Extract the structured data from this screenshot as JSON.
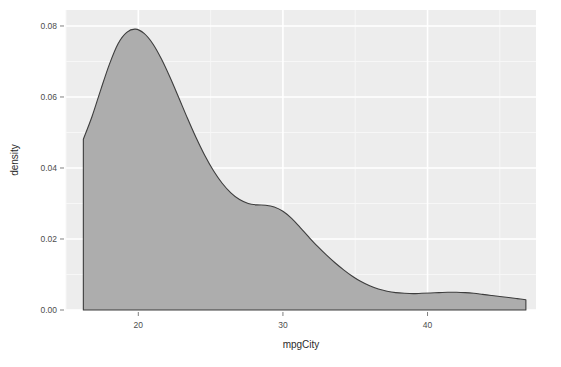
{
  "chart_data": {
    "type": "area",
    "title": "",
    "subtitle": "",
    "xlabel": "mpgCity",
    "ylabel": "density",
    "xlim": [
      15.0,
      47.5
    ],
    "ylim": [
      0.0,
      0.0845
    ],
    "x_ticks": [
      20,
      30,
      40
    ],
    "x_tick_labels": [
      "20",
      "30",
      "40"
    ],
    "y_ticks": [
      0.0,
      0.02,
      0.04,
      0.06,
      0.08
    ],
    "y_tick_labels": [
      "0.00",
      "0.02",
      "0.04",
      "0.06",
      "0.08"
    ],
    "x_minor_ticks": [
      15,
      25,
      35,
      45
    ],
    "y_minor_ticks": [
      0.01,
      0.03,
      0.05,
      0.07
    ],
    "grid": true,
    "legend": "none",
    "series": [
      {
        "name": "density",
        "fill_color": "#ADADAD",
        "line_color": "#3d3d3d",
        "x": [
          16.2,
          16.8,
          17.4,
          18.0,
          18.6,
          19.2,
          19.8,
          20.4,
          21.0,
          21.6,
          22.2,
          22.8,
          23.4,
          24.0,
          24.6,
          25.2,
          25.8,
          26.4,
          27.0,
          27.6,
          28.2,
          28.8,
          29.4,
          30.0,
          30.6,
          31.2,
          31.8,
          32.4,
          33.0,
          33.6,
          34.2,
          34.8,
          35.4,
          36.0,
          36.6,
          37.2,
          37.8,
          38.4,
          39.0,
          39.6,
          40.2,
          40.8,
          41.4,
          42.0,
          42.6,
          43.2,
          43.8,
          44.4,
          45.0,
          45.6,
          46.2,
          46.8
        ],
        "y": [
          0.0481,
          0.0545,
          0.062,
          0.0692,
          0.075,
          0.0782,
          0.0791,
          0.0779,
          0.075,
          0.0707,
          0.0655,
          0.0598,
          0.054,
          0.0485,
          0.0435,
          0.0392,
          0.0357,
          0.033,
          0.0311,
          0.03,
          0.0296,
          0.0295,
          0.029,
          0.0278,
          0.0258,
          0.0232,
          0.0205,
          0.0179,
          0.0155,
          0.0133,
          0.0113,
          0.0095,
          0.008,
          0.0068,
          0.0059,
          0.0053,
          0.0049,
          0.0047,
          0.0046,
          0.0047,
          0.0048,
          0.0049,
          0.005,
          0.005,
          0.0049,
          0.0047,
          0.0044,
          0.0041,
          0.0038,
          0.0035,
          0.0032,
          0.0029
        ]
      }
    ],
    "peak": {
      "x": 19.8,
      "y": 0.0791
    },
    "shoulder": {
      "x": 28.6,
      "y": 0.0296
    },
    "tail_bump": {
      "x": 41.6,
      "y": 0.005
    }
  },
  "panel": {
    "background_color": "#EDEDED",
    "major_grid_color": "#FFFFFF",
    "minor_grid_color": "#F7F7F7",
    "outer_background_color": "#FFFFFF",
    "tick_mark_color": "#808080",
    "tick_label_color": "#4D4D4D",
    "axis_title_color": "#2B2B2B"
  }
}
